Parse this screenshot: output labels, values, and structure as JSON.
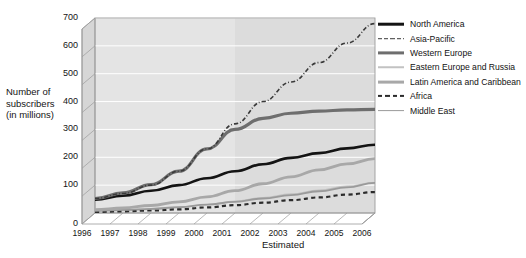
{
  "chart_data": {
    "type": "line",
    "title": "",
    "subtitle": "",
    "xlabel": "",
    "ylabel": "Number of subscribers (in millions)",
    "ylabel_lines": [
      "Number of",
      "subscribers",
      "(in millions)"
    ],
    "x": [
      1996,
      1997,
      1998,
      1999,
      2000,
      2001,
      2002,
      2003,
      2004,
      2005,
      2006
    ],
    "xtick_labels": [
      "1996",
      "1997",
      "1998",
      "1999",
      "2000",
      "2001",
      "2002",
      "2003",
      "2004",
      "2005",
      "2006"
    ],
    "ytick_labels": [
      "0",
      "100",
      "200",
      "300",
      "400",
      "500",
      "600",
      "700"
    ],
    "ytick_values": [
      0,
      100,
      200,
      300,
      400,
      500,
      600,
      700
    ],
    "ylim": [
      0,
      700
    ],
    "xlim": [
      1996,
      2006
    ],
    "grid": true,
    "legend_position": "right",
    "annotations": [
      {
        "text": "Estimated",
        "x_from": 2001,
        "x_to": 2006,
        "note": "shaded band covering 2001 through 2006"
      }
    ],
    "series": [
      {
        "name": "North America",
        "style": "solid",
        "width": 2.6,
        "color": "#141414",
        "values": [
          48,
          62,
          80,
          100,
          125,
          150,
          175,
          198,
          215,
          232,
          245
        ]
      },
      {
        "name": "Asia-Pacific",
        "style": "dash-dot",
        "width": 1.6,
        "color": "#3a3a3a",
        "values": [
          52,
          70,
          100,
          150,
          230,
          320,
          400,
          470,
          540,
          610,
          680
        ]
      },
      {
        "name": "Western Europe",
        "style": "solid",
        "width": 3.2,
        "color": "#6e6e6e",
        "values": [
          52,
          72,
          102,
          150,
          230,
          300,
          340,
          358,
          366,
          370,
          372
        ]
      },
      {
        "name": "Eastern Europe and Russia",
        "style": "solid",
        "width": 1.4,
        "color": "#c2c2c2",
        "values": [
          6,
          9,
          13,
          20,
          30,
          42,
          55,
          68,
          82,
          96,
          110
        ]
      },
      {
        "name": "Latin America and Caribbean",
        "style": "solid",
        "width": 2.8,
        "color": "#a8a8a8",
        "values": [
          12,
          18,
          27,
          40,
          58,
          80,
          105,
          130,
          155,
          176,
          195
        ]
      },
      {
        "name": "Africa",
        "style": "dashed",
        "width": 2.2,
        "color": "#2b2b2b",
        "values": [
          4,
          6,
          9,
          13,
          20,
          28,
          37,
          46,
          56,
          66,
          75
        ]
      },
      {
        "name": "Middle East",
        "style": "solid",
        "width": 1.8,
        "color": "#9a9a9a",
        "values": [
          8,
          11,
          15,
          21,
          30,
          40,
          52,
          64,
          78,
          92,
          108
        ]
      }
    ]
  },
  "legend": {
    "items": [
      {
        "label": "North America"
      },
      {
        "label": "Asia-Pacific"
      },
      {
        "label": "Western Europe"
      },
      {
        "label": "Eastern Europe and Russia"
      },
      {
        "label": "Latin America and Caribbean"
      },
      {
        "label": "Africa"
      },
      {
        "label": "Middle East"
      }
    ]
  },
  "colors": {
    "plot_background": "#e4e4e4",
    "wall_shade": "#d6d6d6",
    "estimated_band": "#dcdcdc",
    "gridline": "#ffffff",
    "axis_line": "#9b9b9b",
    "page_background": "#ffffff",
    "text": "#141414"
  }
}
